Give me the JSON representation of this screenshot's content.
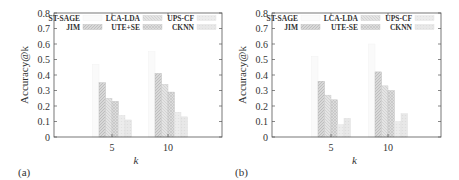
{
  "chart_data": [
    {
      "type": "bar",
      "panel_label": "(a)",
      "title": "",
      "xlabel": "k",
      "ylabel": "Accuracy@k",
      "ylim": [
        0,
        0.8
      ],
      "yticks": [
        "0",
        "0.1",
        "0.2",
        "0.3",
        "0.4",
        "0.5",
        "0.6",
        "0.7",
        "0.8"
      ],
      "categories": [
        "5",
        "10"
      ],
      "grid": false,
      "legend_position": "top, 3 columns inside plot",
      "series": [
        {
          "name": "ST-SAGE",
          "values": [
            0.47,
            0.55
          ]
        },
        {
          "name": "JIM",
          "values": [
            0.35,
            0.41
          ]
        },
        {
          "name": "LCA-LDA",
          "values": [
            0.25,
            0.34
          ]
        },
        {
          "name": "UTE+SE",
          "values": [
            0.23,
            0.29
          ]
        },
        {
          "name": "UPS-CF",
          "values": [
            0.14,
            0.16
          ]
        },
        {
          "name": "CKNN",
          "values": [
            0.11,
            0.13
          ]
        }
      ]
    },
    {
      "type": "bar",
      "panel_label": "(b)",
      "title": "",
      "xlabel": "k",
      "ylabel": "Accuracy@k",
      "ylim": [
        0,
        0.8
      ],
      "yticks": [
        "0",
        "0.1",
        "0.2",
        "0.3",
        "0.4",
        "0.5",
        "0.6",
        "0.7",
        "0.8"
      ],
      "categories": [
        "5",
        "10"
      ],
      "grid": false,
      "legend_position": "top, 3 columns inside plot",
      "series": [
        {
          "name": "ST-SAGE",
          "values": [
            0.52,
            0.6
          ]
        },
        {
          "name": "JIM",
          "values": [
            0.36,
            0.42
          ]
        },
        {
          "name": "LCA-LDA",
          "values": [
            0.27,
            0.33
          ]
        },
        {
          "name": "UTE-SE",
          "values": [
            0.24,
            0.3
          ]
        },
        {
          "name": "UPS-CF",
          "values": [
            0.08,
            0.1
          ]
        },
        {
          "name": "CKNN",
          "values": [
            0.12,
            0.15
          ]
        }
      ]
    }
  ],
  "styles": {
    "axis_color": "#555555",
    "text_color": "#333333",
    "series_fills": [
      "#fafafa",
      "#d8d8d8",
      "#e4e4e4",
      "#dcdcdc",
      "#ececec",
      "#e8e8e8"
    ],
    "series_strokes": [
      "#f0f0f0",
      "#b8b8b8",
      "#c8c8c8",
      "#c0c0c0",
      "#e0e0e0",
      "#dcdcdc"
    ]
  }
}
